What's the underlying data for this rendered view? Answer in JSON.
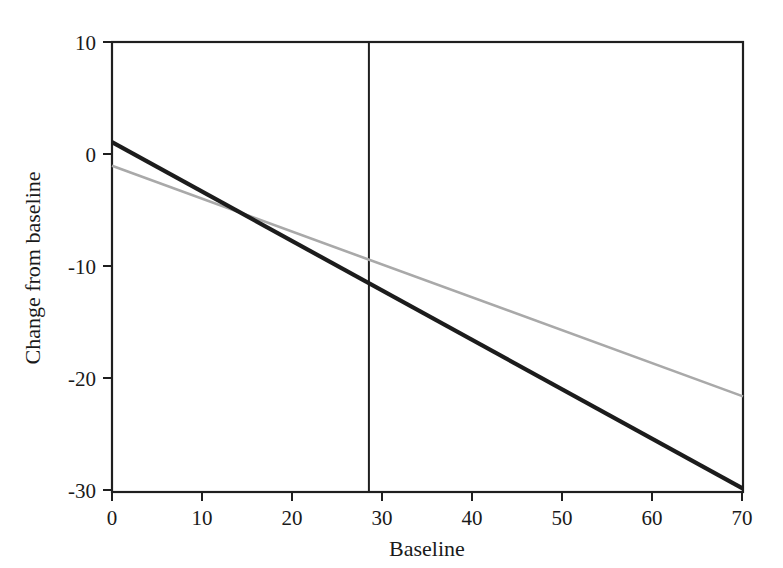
{
  "chart_data": {
    "type": "line",
    "title": "",
    "subtitle": "",
    "xlabel": "Baseline",
    "ylabel": "Change from baseline",
    "xlim": [
      0,
      70
    ],
    "ylim": [
      -30,
      10
    ],
    "xticks": [
      0,
      10,
      20,
      30,
      40,
      50,
      60,
      70
    ],
    "xtick_labels": [
      "0",
      "10",
      "20",
      "30",
      "40",
      "50",
      "60",
      "70"
    ],
    "yticks": [
      10,
      0,
      -10,
      -20,
      -30
    ],
    "ytick_labels": [
      "10",
      "0",
      "-10",
      "-20",
      "-30"
    ],
    "grid": false,
    "legend": "none",
    "frame": "box",
    "series": [
      {
        "name": "dark-regression-line",
        "color": "#1c1c1c",
        "width": 4.2,
        "x": [
          0,
          70
        ],
        "values": [
          1.1,
          -29.7
        ],
        "slope": -0.44,
        "intercept": 1.1
      },
      {
        "name": "gray-regression-line",
        "color": "#a9a9a9",
        "width": 2.6,
        "x": [
          0,
          70
        ],
        "values": [
          -1.0,
          -21.5
        ],
        "slope": -0.293,
        "intercept": -1.0
      }
    ],
    "annotations": [
      {
        "name": "vertical-reference-line",
        "type": "vline",
        "x": 28.5,
        "color": "#1f1f1f"
      }
    ],
    "crossing_point": {
      "x": 14.0,
      "y": -5.1
    }
  },
  "axis": {
    "x_label": "Baseline",
    "y_label": "Change from baseline"
  },
  "colors": {
    "background": "#ffffff",
    "axis": "#1f1f1f",
    "series_dark": "#1c1c1c",
    "series_gray": "#a9a9a9",
    "reference_line": "#1f1f1f"
  }
}
